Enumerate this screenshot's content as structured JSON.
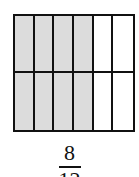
{
  "diagram": {
    "type": "fraction-area-model",
    "rows": 2,
    "columns": 6,
    "shaded_columns": 4,
    "shaded_cells": 8,
    "total_cells": 12,
    "shade_color": "#dcdcdc",
    "line_color": "#111111"
  },
  "fraction": {
    "numerator": "8",
    "denominator": "12"
  }
}
